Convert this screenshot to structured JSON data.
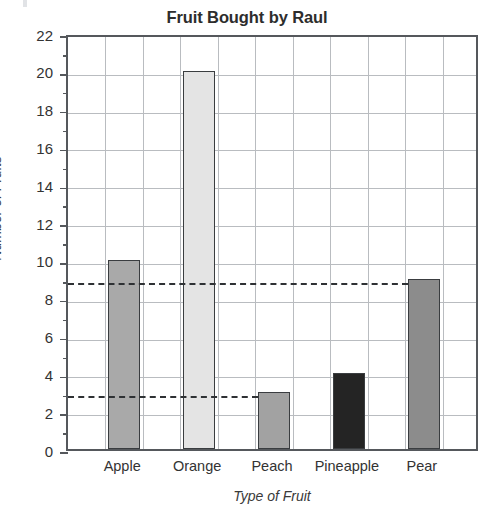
{
  "chart_data": {
    "type": "bar",
    "title": "Fruit Bought by Raul",
    "xlabel": "Type of Fruit",
    "ylabel": "Number of Fruits",
    "categories": [
      "Apple",
      "Orange",
      "Peach",
      "Pineapple",
      "Pear"
    ],
    "values": [
      10,
      20,
      3,
      4,
      9
    ],
    "bar_colors": [
      "#a9a9a9",
      "#e4e4e4",
      "#a2a2a2",
      "#242424",
      "#8c8c8c"
    ],
    "bar_border_color": "#3a3d40",
    "ylim": [
      0,
      22
    ],
    "ytick_step": 2,
    "ytick_minor_step": 1,
    "ytick_labels": [
      "0",
      "2",
      "4",
      "6",
      "8",
      "10",
      "12",
      "14",
      "16",
      "18",
      "20",
      "22"
    ],
    "ytick_values": [
      0,
      2,
      4,
      6,
      8,
      10,
      12,
      14,
      16,
      18,
      20,
      22
    ],
    "grid": true,
    "grid_color": "#b9bcc0",
    "axis_color": "#55585c",
    "legend": null,
    "annotations": [
      {
        "name": "reference-line-9",
        "type": "dashed-horizontal",
        "value": 9,
        "extends_to_category": "Pear"
      },
      {
        "name": "reference-line-3",
        "type": "dashed-horizontal",
        "value": 3,
        "extends_to_category": "Peach"
      }
    ],
    "x_grid_cells": 11,
    "bar_cell_indices": [
      1,
      3,
      5,
      7,
      9
    ]
  }
}
